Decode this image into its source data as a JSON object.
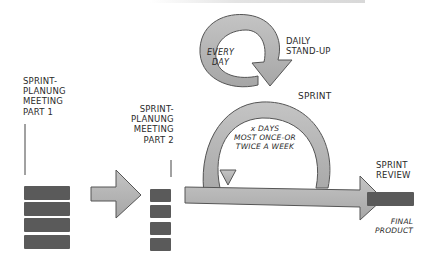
{
  "diagram": {
    "type": "scrum-process-sketch",
    "colors": {
      "arrow_fill": "#b3b3b3",
      "arrow_stroke": "#555555",
      "block_fill": "#5a5a5a",
      "text": "#2a2a2a",
      "background": "#ffffff"
    },
    "labels": {
      "planning_part1": [
        "SPRINT-",
        "PLANUNG",
        "MEETING",
        "PART 1"
      ],
      "planning_part2": [
        "SPRINT-",
        "PLANUNG",
        "MEETING",
        "PART 2"
      ],
      "every_day": [
        "EVERY",
        "DAY"
      ],
      "daily_standup": [
        "DAILY",
        "STAND-UP"
      ],
      "sprint": "SPRINT",
      "sprint_loop": [
        "x DAYS",
        "MOST ONCE-OR",
        "TWICE A WEEK"
      ],
      "sprint_review": [
        "SPRINT",
        "REVIEW"
      ],
      "final_product": [
        "FINAL",
        "PRODUCT"
      ]
    },
    "stages": [
      {
        "name": "Sprint Planning Meeting Part 1",
        "blocks": 4
      },
      {
        "name": "Sprint Planning Meeting Part 2",
        "blocks": 4
      },
      {
        "name": "Sprint",
        "loops": [
          "Daily Stand-Up (every day)",
          "Sprint (x days)"
        ]
      },
      {
        "name": "Sprint Review",
        "output": "Final Product"
      }
    ]
  }
}
